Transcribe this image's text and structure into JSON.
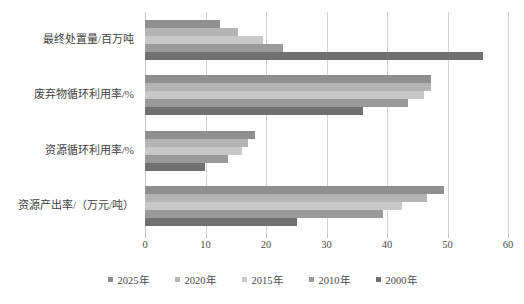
{
  "chart_data": {
    "type": "bar",
    "orientation": "horizontal",
    "title": "",
    "subtitle": "",
    "xlabel": "",
    "ylabel": "",
    "xlim": [
      0,
      60
    ],
    "ylim": null,
    "xticks": [
      0,
      10,
      20,
      30,
      40,
      50,
      60
    ],
    "xtick_labels": [
      "0",
      "10",
      "20",
      "30",
      "40",
      "50",
      "60"
    ],
    "grid": "vertical",
    "legend_position": "bottom-center",
    "categories": [
      "最终处置量/百万吨",
      "废弃物循环利用率/%",
      "资源循环利用率/%",
      "资源产出率/（万元/吨）"
    ],
    "series": [
      {
        "name": "2025年",
        "color": "#8f8f8f",
        "values": [
          12.4,
          47.2,
          18.2,
          49.4
        ]
      },
      {
        "name": "2020年",
        "color": "#b4b4b4",
        "values": [
          15.4,
          47.2,
          17.0,
          46.6
        ]
      },
      {
        "name": "2015年",
        "color": "#c8c8c8",
        "values": [
          19.5,
          46.1,
          16.0,
          42.5
        ]
      },
      {
        "name": "2010年",
        "color": "#9a9a9a",
        "values": [
          22.8,
          43.5,
          13.7,
          39.3
        ]
      },
      {
        "name": "2000年",
        "color": "#707070",
        "values": [
          55.8,
          36.0,
          9.9,
          25.1
        ]
      }
    ]
  },
  "legend": {
    "items": [
      {
        "label": "2025年",
        "color": "#8f8f8f"
      },
      {
        "label": "2020年",
        "color": "#b4b4b4"
      },
      {
        "label": "2015年",
        "color": "#c8c8c8"
      },
      {
        "label": "2010年",
        "color": "#9a9a9a"
      },
      {
        "label": "2000年",
        "color": "#707070"
      }
    ]
  },
  "axis": {
    "x_tick_labels": [
      "0",
      "10",
      "20",
      "30",
      "40",
      "50",
      "60"
    ]
  },
  "colors": {
    "gridline": "#d2d2d2",
    "text": "#3f3f3f",
    "background": "#ffffff"
  }
}
